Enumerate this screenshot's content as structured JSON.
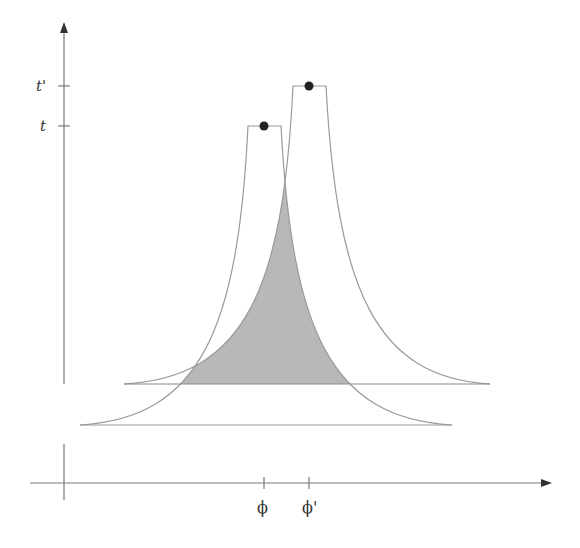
{
  "diagram": {
    "type": "two overlapping peaked distributions over a parameter axis",
    "y_axis": {
      "ticks": [
        {
          "label": "t'",
          "y": 86
        },
        {
          "label": "t",
          "y": 126
        }
      ]
    },
    "x_axis": {
      "ticks": [
        {
          "label": "ϕ",
          "x": 264
        },
        {
          "label": "ϕ'",
          "x": 309
        }
      ]
    },
    "curves": [
      {
        "name": "curve-phi",
        "peak_label": "t at ϕ",
        "baseline_y": 425,
        "span": [
          80,
          452
        ]
      },
      {
        "name": "curve-phi-prime",
        "peak_label": "t' at ϕ'",
        "baseline_y": 384,
        "span": [
          124,
          490
        ]
      }
    ],
    "shaded_region": "overlap under both curves above upper baseline",
    "colors": {
      "line": "#9a9a9a",
      "axis": "#7a7a7a",
      "fill": "#b8b8b8",
      "dot": "#222222"
    }
  }
}
